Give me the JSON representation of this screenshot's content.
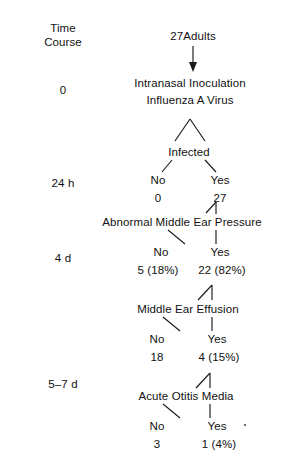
{
  "figure": {
    "background_color": "#ffffff",
    "ink_color": "#111111",
    "time_course_header": {
      "line1": "Time",
      "line2": "Course"
    },
    "time_points": [
      {
        "id": "t0",
        "label": "0"
      },
      {
        "id": "t24h",
        "label": "24 h"
      },
      {
        "id": "t4d",
        "label": "4 d"
      },
      {
        "id": "t57d",
        "label": "5–7 d"
      }
    ],
    "cohort": {
      "label": "27Adults"
    },
    "stages": [
      {
        "id": "inoculation",
        "line1": "Intranasal Inoculation",
        "line2": "Influenza A Virus"
      },
      {
        "id": "infected",
        "line1": "Infected"
      },
      {
        "id": "pressure",
        "line1": "Abnormal Middle Ear Pressure"
      },
      {
        "id": "effusion",
        "line1": "Middle Ear Effusion"
      },
      {
        "id": "otitis",
        "line1": "Acute Otitis Media"
      }
    ],
    "branches": [
      {
        "id": "infected-branch",
        "stage": "Infected",
        "no": {
          "label": "No",
          "count": "0"
        },
        "yes": {
          "label": "Yes",
          "count": "27"
        }
      },
      {
        "id": "pressure-branch",
        "stage": "Abnormal Middle Ear Pressure",
        "no": {
          "label": "No",
          "count": "5 (18%)"
        },
        "yes": {
          "label": "Yes",
          "count": "22 (82%)"
        }
      },
      {
        "id": "effusion-branch",
        "stage": "Middle Ear Effusion",
        "no": {
          "label": "No",
          "count": "18"
        },
        "yes": {
          "label": "Yes",
          "count": "4 (15%)"
        }
      },
      {
        "id": "otitis-branch",
        "stage": "Acute Otitis Media",
        "no": {
          "label": "No",
          "count": "3"
        },
        "yes": {
          "label": "Yes",
          "count": "1 (4%)"
        }
      }
    ]
  }
}
